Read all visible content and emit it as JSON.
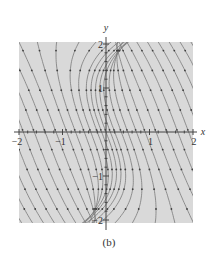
{
  "figure": {
    "caption": "(b)",
    "background_color": "#d9d9d9",
    "line_color": "#7a7a7a",
    "arrow_color": "#3f3f3f",
    "axis_color": "#444444"
  },
  "chart_data": {
    "type": "streamplot",
    "title": "",
    "subtitle": "",
    "xlabel": "x",
    "ylabel": "y",
    "xlim": [
      -2,
      2
    ],
    "ylim": [
      -2,
      2
    ],
    "x_ticks": [
      -2,
      -1,
      1,
      2
    ],
    "x_tick_labels": [
      "−2",
      "−1",
      "1",
      "2"
    ],
    "y_ticks": [
      -2,
      -1,
      1,
      2
    ],
    "y_tick_labels": [
      "−2",
      "−1",
      "1",
      "2"
    ],
    "grid": false,
    "legend": null,
    "trajectory_family": "x = c - 0.35*y + 0.12*y^3 * w(c), w(c) localized near c = 0",
    "offsets_c": [
      -2.9,
      -2.65,
      -2.4,
      -2.15,
      -1.9,
      -1.65,
      -1.4,
      -1.15,
      -0.9,
      -0.7,
      -0.5,
      -0.35,
      -0.2,
      -0.1,
      0.0,
      0.1,
      0.2,
      0.35,
      0.5,
      0.7,
      0.9,
      1.15,
      1.4,
      1.65,
      1.9,
      2.15,
      2.4,
      2.65,
      2.9
    ],
    "arrow_direction": "downward along trajectories"
  }
}
